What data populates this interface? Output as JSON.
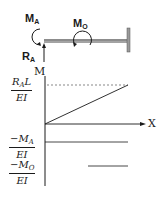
{
  "diagram": {
    "beam": {
      "labels": {
        "moment_a": {
          "main": "M",
          "sub": "A"
        },
        "moment_o": {
          "main": "M",
          "sub": "O"
        },
        "reaction_a": {
          "main": "R",
          "sub": "A"
        }
      },
      "support": "fixed-wall-right"
    },
    "moment_diagram": {
      "y_axis_label": "M",
      "x_axis_label": "X",
      "tick_labels": [
        {
          "num_main": "R",
          "num_sub": "A",
          "num_tail": "L",
          "den": "EI"
        },
        {
          "num_main": "−M",
          "num_sub": "A",
          "num_tail": "",
          "den": "EI"
        },
        {
          "num_main": "−M",
          "num_sub": "O",
          "num_tail": "",
          "den": "EI"
        }
      ],
      "lines": [
        {
          "name": "RaL-over-EI-reference",
          "style": "dashed",
          "from_x": 0,
          "to_x": 1,
          "level": "RaL/EI"
        },
        {
          "name": "RaL-linear",
          "style": "solid",
          "from_x": 0,
          "to_x": 1,
          "from": 0,
          "to": "RaL/EI"
        },
        {
          "name": "minus-Ma-constant",
          "style": "solid",
          "from_x": 0,
          "to_x": 1,
          "level": "-Ma/EI"
        },
        {
          "name": "minus-Mo-step",
          "style": "solid",
          "from_x": 0.5,
          "to_x": 1,
          "level": "-Mo/EI"
        }
      ]
    },
    "colors": {
      "ink": "#1a1a1a",
      "wall": "#9a9a9a",
      "background": "#ffffff"
    }
  }
}
